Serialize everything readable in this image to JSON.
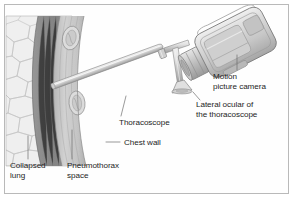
{
  "figure": {
    "border_color": "#b9b9b9",
    "background_color": "#fefefe"
  },
  "labels": {
    "motion_camera": "Motion\npicture camera",
    "lateral_ocular": "Lateral ocular of\nthe thoracoscope",
    "thoracoscope": "Thoracoscope",
    "chest_wall": "Chest wall",
    "collapsed_lung": "Collapsed\nlung",
    "pneumothorax_space": "Pneumothorax\nspace"
  },
  "anatomy": {
    "collapsed_lung": {
      "name": "collapsed-lung",
      "fill": "#efefef",
      "cell_stroke": "#c6c6c6"
    },
    "pneumothorax_space": {
      "name": "pneumothorax-space",
      "fill": "#8c8c8c",
      "striation_stroke": "#7d7d7d"
    },
    "chest_wall": {
      "name": "chest-wall",
      "fill": "#c9c9c9",
      "stroke": "#9a9a9a",
      "rib_count": 2,
      "rib_fill": "#d8d8d8"
    }
  },
  "instruments": {
    "thoracoscope": {
      "name": "thoracoscope-shaft",
      "fill": "#dedede",
      "stroke": "#8e8e8e"
    },
    "lateral_ocular": {
      "name": "lateral-ocular",
      "fill": "#e2e2e2",
      "stroke": "#8e8e8e"
    },
    "camera": {
      "name": "motion-picture-camera",
      "body_fill": "#d5d5d5",
      "stroke": "#7f7f7f",
      "lens_fill": "#c2c2c2"
    }
  },
  "leader_lines": {
    "color": "#6e6e6e",
    "width": 0.7
  }
}
